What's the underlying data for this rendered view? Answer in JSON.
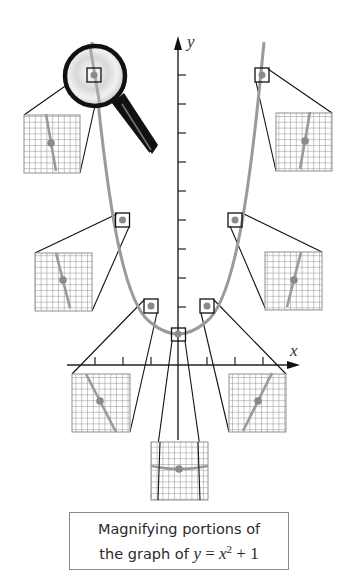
{
  "figure": {
    "type": "diagram",
    "axes": {
      "x_label": "x",
      "y_label": "y"
    },
    "function": "y = x^2 + 1",
    "magnified_points": [
      {
        "id": "upper-left",
        "slope": "steep-negative"
      },
      {
        "id": "mid-left",
        "slope": "negative"
      },
      {
        "id": "low-left",
        "slope": "mild-negative"
      },
      {
        "id": "vertex",
        "slope": "zero"
      },
      {
        "id": "low-right",
        "slope": "mild-positive"
      },
      {
        "id": "mid-right",
        "slope": "positive"
      },
      {
        "id": "upper-right",
        "slope": "steep-positive"
      }
    ],
    "icons": [
      "magnifying-glass-icon"
    ],
    "colors": {
      "curve": "#9a9a9a",
      "axes": "#222222",
      "grid": "#8f8f8f",
      "point": "#8a8a8a",
      "lens_rim": "#111111"
    }
  },
  "caption": {
    "line1": "Magnifying portions of",
    "line2_prefix": "the graph of ",
    "line2_y": "y",
    "line2_eq": " = ",
    "line2_x": "x",
    "line2_exp": "2",
    "line2_suffix": " + 1"
  }
}
